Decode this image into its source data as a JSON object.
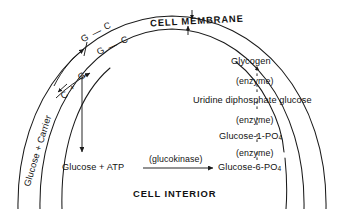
{
  "diagram": {
    "title_membrane": "CELL MEMBRANE",
    "title_interior": "CELL INTERIOR",
    "membrane": {
      "outer_label": "CELL MEMBRANE",
      "inward_arrow": "arrow-down",
      "outward_arrow": "arrow-up"
    },
    "left_pathway": {
      "substrate": "Glucose + Carrier",
      "complex_top_1": "G",
      "complex_dash_1": "—",
      "complex_top_1b": "C",
      "complex_top_2": "G",
      "complex_dash_2": "—",
      "complex_top_2b": "C",
      "release_c": "C",
      "release_plus": "+",
      "release_g": "G"
    },
    "interior_reaction": {
      "reactants": "Glucose + ATP",
      "enzyme": "(glucokinase)",
      "product": "Glucose-6-PO",
      "product_sub": "4"
    },
    "glycogen_pathway": {
      "steps": [
        {
          "label": "Glycogen",
          "sub": ""
        },
        {
          "label": "(enzyme)",
          "sub": ""
        },
        {
          "label": "Uridine diphosphate glucose",
          "sub": ""
        },
        {
          "label": "(enzyme)",
          "sub": ""
        },
        {
          "label": "Glucose-1-PO",
          "sub": "4"
        },
        {
          "label": "(enzyme)",
          "sub": ""
        },
        {
          "label": "Glucose-6-PO",
          "sub": "4"
        }
      ]
    },
    "colors": {
      "ink": "#121212",
      "background": "#ffffff",
      "line": "#1a1a1a"
    }
  }
}
